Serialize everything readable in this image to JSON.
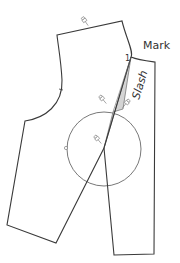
{
  "diagram": {
    "labels": {
      "mark": "Mark",
      "slash": "Slash",
      "point_number": "1"
    },
    "colors": {
      "outline": "#3a3a3a",
      "wedge_fill": "#d4d4d4",
      "circle": "#555555"
    },
    "pieces": [
      {
        "name": "left-pattern-piece",
        "description": "bodice side with armhole, slashed and spread"
      },
      {
        "name": "right-pattern-piece",
        "description": "center front panel with neckline"
      }
    ],
    "markers": {
      "pivot_circle": {
        "cx": 104,
        "cy": 149,
        "r": 37
      },
      "pin_count": 4
    }
  }
}
